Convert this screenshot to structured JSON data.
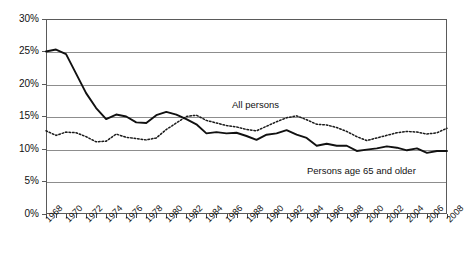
{
  "chart_data": {
    "type": "line",
    "title": "",
    "xlabel": "",
    "ylabel": "",
    "ylim": [
      0,
      30
    ],
    "xlim": [
      1968,
      2008
    ],
    "grid": true,
    "legend_position": "inline-annotations",
    "ytick_labels": [
      "0%",
      "5%",
      "10%",
      "15%",
      "20%",
      "25%",
      "30%"
    ],
    "ytick_values": [
      0,
      5,
      10,
      15,
      20,
      25,
      30
    ],
    "xtick_labels": [
      "1968",
      "1970",
      "1972",
      "1974",
      "1976",
      "1978",
      "1980",
      "1982",
      "1984",
      "1986",
      "1988",
      "1990",
      "1992",
      "1994",
      "1996",
      "1998",
      "2000",
      "2002",
      "2004",
      "2006",
      "2008"
    ],
    "x": [
      1968,
      1969,
      1970,
      1971,
      1972,
      1973,
      1974,
      1975,
      1976,
      1977,
      1978,
      1979,
      1980,
      1981,
      1982,
      1983,
      1984,
      1985,
      1986,
      1987,
      1988,
      1989,
      1990,
      1991,
      1992,
      1993,
      1994,
      1995,
      1996,
      1997,
      1998,
      1999,
      2000,
      2001,
      2002,
      2003,
      2004,
      2005,
      2006,
      2007,
      2008
    ],
    "series": [
      {
        "name": "All persons",
        "style": "dotted",
        "annotation": "All persons",
        "values": [
          12.8,
          12.1,
          12.6,
          12.5,
          11.9,
          11.1,
          11.2,
          12.3,
          11.8,
          11.6,
          11.4,
          11.7,
          13.0,
          14.0,
          15.0,
          15.2,
          14.4,
          14.0,
          13.6,
          13.4,
          13.0,
          12.8,
          13.5,
          14.2,
          14.8,
          15.1,
          14.5,
          13.8,
          13.7,
          13.3,
          12.7,
          11.9,
          11.3,
          11.7,
          12.1,
          12.5,
          12.7,
          12.6,
          12.3,
          12.5,
          13.2
        ]
      },
      {
        "name": "Persons age 65 and older",
        "style": "solid",
        "annotation": "Persons age 65 and older",
        "values": [
          25.0,
          25.3,
          24.6,
          21.6,
          18.6,
          16.3,
          14.6,
          15.3,
          15.0,
          14.1,
          14.0,
          15.2,
          15.7,
          15.3,
          14.6,
          13.8,
          12.4,
          12.6,
          12.4,
          12.5,
          12.0,
          11.4,
          12.2,
          12.4,
          12.9,
          12.2,
          11.7,
          10.5,
          10.8,
          10.5,
          10.5,
          9.7,
          9.9,
          10.1,
          10.4,
          10.2,
          9.8,
          10.1,
          9.4,
          9.7,
          9.7
        ]
      }
    ]
  },
  "annotations": {
    "all_persons": "All persons",
    "persons_65_older": "Persons age 65 and older"
  },
  "colors": {
    "line": "#1a1a1a",
    "gridline": "#8d8d8d",
    "border": "#5a5a5a",
    "background": "#ffffff"
  }
}
